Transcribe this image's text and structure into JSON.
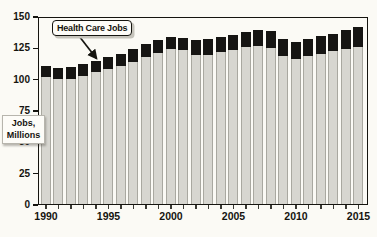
{
  "chart_data": {
    "type": "bar",
    "stacked": true,
    "title": "",
    "xlabel": "",
    "ylabel": "Jobs, Millions",
    "ylabel_lines": [
      "Jobs,",
      "Millions"
    ],
    "ylim": [
      0,
      150
    ],
    "yticks": [
      0,
      25,
      50,
      75,
      100,
      125,
      150
    ],
    "x": [
      1990,
      1991,
      1992,
      1993,
      1994,
      1995,
      1996,
      1997,
      1998,
      1999,
      2000,
      2001,
      2002,
      2003,
      2004,
      2005,
      2006,
      2007,
      2008,
      2009,
      2010,
      2011,
      2012,
      2013,
      2014,
      2015
    ],
    "xtick_labeled": [
      1990,
      1995,
      2000,
      2005,
      2010,
      2015
    ],
    "grid": false,
    "legend": "none",
    "series": [
      {
        "name": "",
        "role": "all-other-jobs-base-segment",
        "color": "#d7d6d0",
        "values": [
          101.5,
          100,
          100,
          102.5,
          105,
          107.5,
          110,
          113.5,
          117,
          120.5,
          123.5,
          123,
          119,
          119,
          121,
          123,
          125,
          126,
          124.5,
          118,
          116,
          118,
          120,
          122,
          124,
          125.5
        ]
      },
      {
        "name": "Health Care Jobs",
        "role": "health-care-jobs-top-segment",
        "color": "#161513",
        "values": [
          8.5,
          8.5,
          9,
          9,
          9.5,
          10,
          10,
          10,
          10.5,
          10,
          10,
          9.5,
          12,
          12.5,
          12,
          12,
          12,
          12.5,
          13.5,
          14,
          13.5,
          13.5,
          14,
          14,
          14.5,
          15.5
        ]
      }
    ],
    "totals": [
      110,
      108.5,
      109,
      111.5,
      114.5,
      117.5,
      120,
      123.5,
      127.5,
      130.5,
      133.5,
      132.5,
      131,
      131.5,
      133,
      135,
      137,
      138.5,
      138,
      132,
      129.5,
      131.5,
      134,
      136,
      138.5,
      141
    ],
    "annotation": {
      "label": "Health Care Jobs",
      "target_year": 1994
    }
  },
  "colors": {
    "background": "#fbfaf5",
    "bar_gray": "#d7d6d0",
    "bar_black": "#161513",
    "axis": "#15140f"
  }
}
